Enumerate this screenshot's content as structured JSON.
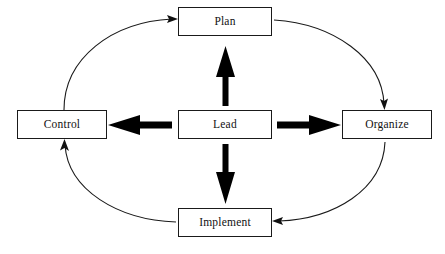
{
  "diagram": {
    "type": "cycle-diagram",
    "background_color": "#ffffff",
    "stroke_color": "#1a1a1a",
    "arrow_fill_color": "#000000",
    "nodes": [
      {
        "id": "plan",
        "label": "Plan",
        "position": "top"
      },
      {
        "id": "control",
        "label": "Control",
        "position": "left"
      },
      {
        "id": "lead",
        "label": "Lead",
        "position": "center"
      },
      {
        "id": "organize",
        "label": "Organize",
        "position": "right"
      },
      {
        "id": "implement",
        "label": "Implement",
        "position": "bottom"
      }
    ],
    "bold_arrows": [
      {
        "id": "lead-to-plan",
        "from": "lead",
        "to": "plan",
        "direction": "up"
      },
      {
        "id": "lead-to-control",
        "from": "lead",
        "to": "control",
        "direction": "left"
      },
      {
        "id": "lead-to-organize",
        "from": "lead",
        "to": "organize",
        "direction": "right"
      },
      {
        "id": "lead-to-implement",
        "from": "lead",
        "to": "implement",
        "direction": "down"
      }
    ],
    "curved_arrows": [
      {
        "id": "control-to-plan",
        "from": "control",
        "to": "plan",
        "quadrant": "top-left"
      },
      {
        "id": "plan-to-organize",
        "from": "plan",
        "to": "organize",
        "quadrant": "top-right"
      },
      {
        "id": "organize-to-implement",
        "from": "organize",
        "to": "implement",
        "quadrant": "bottom-right"
      },
      {
        "id": "implement-to-control",
        "from": "implement",
        "to": "control",
        "quadrant": "bottom-left"
      }
    ]
  }
}
